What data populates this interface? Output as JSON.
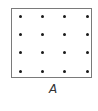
{
  "figure": {
    "label": "A",
    "grid": {
      "rows": 4,
      "cols": 4,
      "dot_color": "#1a1a1a",
      "border_color": "#7a7a7a",
      "col_x": [
        20,
        42,
        64,
        87
      ],
      "row_y": [
        16,
        34,
        52,
        71
      ]
    }
  }
}
